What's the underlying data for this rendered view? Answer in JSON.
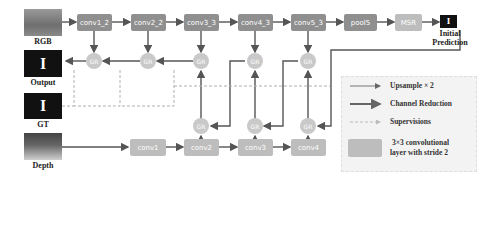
{
  "inputs": {
    "rgb_label": "RGB",
    "output_label": "Output",
    "gt_label": "GT",
    "depth_label": "Depth",
    "output_glyph": "I",
    "gt_glyph": "I",
    "prediction_glyph": "I"
  },
  "rgb_stream": [
    "conv1_2",
    "conv2_2",
    "conv3_3",
    "conv4_3",
    "conv5_3",
    "pool5",
    "MSR"
  ],
  "initial_prediction_label": [
    "Initial",
    "Prediction"
  ],
  "depth_stream": [
    "conv1",
    "conv2",
    "conv3",
    "conv4"
  ],
  "gr_label": "GR",
  "legend": {
    "upsample": "Upsample × 2",
    "channel_reduction": "Channel Reduction",
    "supervisions": "Supervisions",
    "conv_layer_line1": "3×3 convolutional",
    "conv_layer_line2": "layer with stride 2"
  },
  "colors": {
    "box": "#8f8f8f",
    "msr": "#bdbdbd",
    "gr": "#c9c9c9",
    "arrow": "#555555",
    "supervision": "#b0b0b0"
  }
}
